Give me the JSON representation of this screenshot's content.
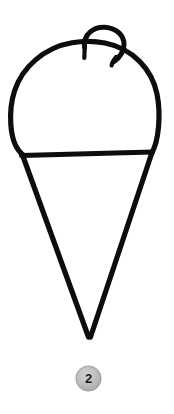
{
  "page": {
    "background_color": "#ffffff",
    "width": 174,
    "height": 414
  },
  "illustration": {
    "name": "ice-cream-cone",
    "description": "Hand-drawn black outline of an ice cream cone: a rounded scoop on top of a triangular wafer cone, with a small curled swirl loop on top of the scoop.",
    "stroke_color": "#0d0d0d",
    "fill_color": "#ffffff",
    "parts": [
      {
        "name": "scoop",
        "label": "Scoop"
      },
      {
        "name": "swirl-loop",
        "label": "Swirl loop"
      },
      {
        "name": "rim-line",
        "label": "Rim line"
      },
      {
        "name": "cone",
        "label": "Cone"
      }
    ]
  },
  "badge": {
    "label": "2",
    "background_color": "#b4b4b4",
    "highlight_color": "#cfcfcf",
    "border_color": "#9a9a9a",
    "text_color": "#1b1b1b"
  }
}
